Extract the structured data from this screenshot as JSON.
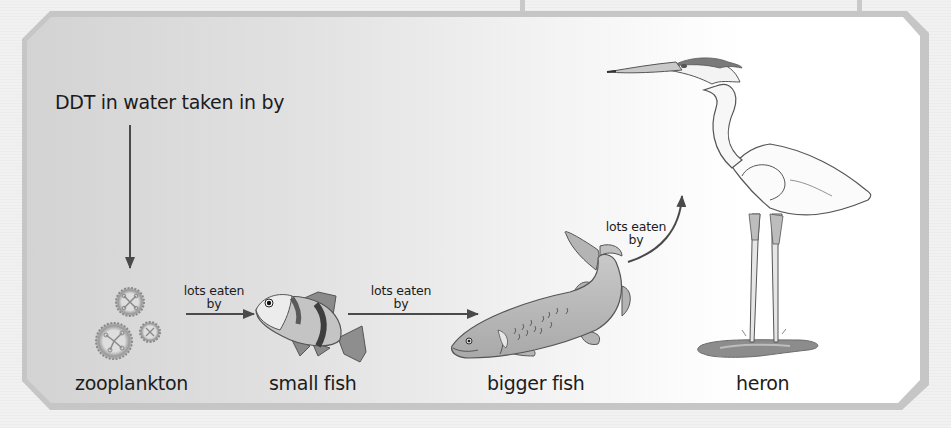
{
  "diagram": {
    "title": "DDT in water taken in by",
    "nodes": [
      {
        "id": "zooplankton",
        "label": "zooplankton"
      },
      {
        "id": "small_fish",
        "label": "small fish"
      },
      {
        "id": "bigger_fish",
        "label": "bigger fish"
      },
      {
        "id": "heron",
        "label": "heron"
      }
    ],
    "edges": [
      {
        "from": "water",
        "to": "zooplankton",
        "label_line1": "",
        "label_line2": ""
      },
      {
        "from": "zooplankton",
        "to": "small_fish",
        "label_line1": "lots eaten",
        "label_line2": "by"
      },
      {
        "from": "small_fish",
        "to": "bigger_fish",
        "label_line1": "lots eaten",
        "label_line2": "by"
      },
      {
        "from": "bigger_fish",
        "to": "heron",
        "label_line1": "lots eaten",
        "label_line2": "by"
      }
    ],
    "icons": {
      "zooplankton": "zooplankton-icon",
      "small_fish": "small-fish-icon",
      "bigger_fish": "bigger-fish-icon",
      "heron": "heron-icon"
    },
    "colors": {
      "frame": "#c6c6c6",
      "arrow": "#4a4a4a",
      "text": "#1c1c1c"
    }
  }
}
